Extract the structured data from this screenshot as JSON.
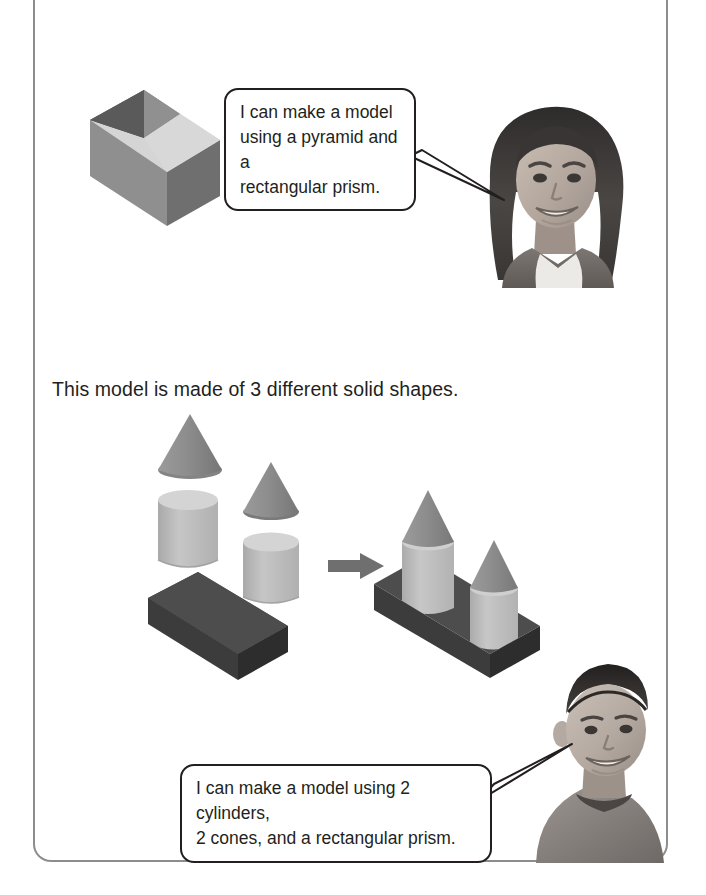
{
  "page": {
    "background_color": "#ffffff",
    "frame_color": "#8d8d8d"
  },
  "instruction": {
    "text": "This model is made of 3 different solid shapes."
  },
  "speech_bubbles": [
    {
      "id": "girl-bubble",
      "line1": "I can make a model",
      "line2": "using a pyramid and a",
      "line3": "rectangular prism.",
      "speaker": "girl"
    },
    {
      "id": "boy-bubble",
      "line1": "I can make a model using 2 cylinders,",
      "line2": "2 cones, and a rectangular prism.",
      "speaker": "boy"
    }
  ],
  "figures": [
    {
      "id": "girl-photo",
      "label": "smiling girl with long dark hair",
      "alt": "Photo of a smiling girl"
    },
    {
      "id": "boy-photo",
      "label": "smiling boy with short hair looking over shoulder",
      "alt": "Photo of a smiling boy"
    }
  ],
  "diagrams": {
    "top_model": {
      "name": "pyramid on rectangular prism",
      "shapes": [
        "pyramid",
        "rectangular prism"
      ],
      "colors": {
        "top": "#9a9a9a",
        "front": "#8a8a8a",
        "side": "#6e6e6e",
        "pyramid_left": "#575757",
        "pyramid_right": "#828282"
      }
    },
    "parts_group": {
      "name": "3 different solid shapes, separated",
      "shapes": [
        "cone",
        "cone",
        "cylinder",
        "cylinder",
        "rectangular prism"
      ],
      "counts": {
        "cones": 2,
        "cylinders": 2,
        "rectangular_prisms": 1
      },
      "colors": {
        "cone": "#8f8f8f",
        "cone_dark": "#7c7c7c",
        "cylinder_top": "#d2d2d2",
        "cylinder_body": "#bcbcbc",
        "cylinder_shade": "#a8a8a8",
        "prism_top": "#4d4d4d",
        "prism_front": "#3c3c3c",
        "prism_side": "#2d2d2d"
      }
    },
    "arrow": {
      "name": "transformation arrow",
      "direction": "right",
      "color": "#6f6f6f"
    },
    "assembled_model": {
      "name": "castle model: 2 cylinders topped with 2 cones on a rectangular prism",
      "shapes": [
        "cone",
        "cylinder",
        "cone",
        "cylinder",
        "rectangular prism"
      ],
      "colors": {
        "cone": "#8f8f8f",
        "cylinder_body": "#bcbcbc",
        "prism_top": "#4d4d4d",
        "prism_front": "#3c3c3c",
        "prism_side": "#2d2d2d"
      }
    }
  }
}
